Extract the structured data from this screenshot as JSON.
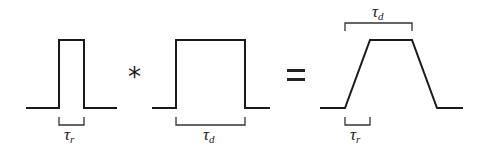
{
  "diagram": {
    "pulse_narrow": {
      "width_label": "τ",
      "width_sub": "r"
    },
    "operator_convolve": "*",
    "pulse_wide": {
      "width_label": "τ",
      "width_sub": "d"
    },
    "operator_equals": "=",
    "result_trapezoid": {
      "top_label": "τ",
      "top_sub": "d",
      "rise_label": "τ",
      "rise_sub": "r"
    },
    "colors": {
      "stroke": "#1a1a1a",
      "background": "#ffffff"
    }
  }
}
